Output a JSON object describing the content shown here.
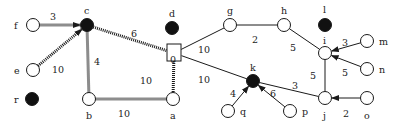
{
  "diagram": {
    "type": "weighted-graph",
    "style": {
      "ink": "#1a1a1a",
      "hollow_fill": "#ffffff",
      "solid_fill": "#111111",
      "background": "#ffffff"
    },
    "nodes": [
      {
        "id": "f",
        "label": "f",
        "x": 33,
        "y": 25,
        "kind": "hollow",
        "lx": 14,
        "ly": 29
      },
      {
        "id": "c",
        "label": "c",
        "x": 87,
        "y": 25,
        "kind": "solid",
        "lx": 84,
        "ly": 14
      },
      {
        "id": "e",
        "label": "e",
        "x": 33,
        "y": 70,
        "kind": "hollow",
        "lx": 14,
        "ly": 74
      },
      {
        "id": "r",
        "label": "r",
        "x": 32,
        "y": 99,
        "kind": "solid",
        "lx": 14,
        "ly": 103
      },
      {
        "id": "b",
        "label": "b",
        "x": 89,
        "y": 99,
        "kind": "hollow",
        "lx": 86,
        "ly": 119
      },
      {
        "id": "a",
        "label": "a",
        "x": 173,
        "y": 99,
        "kind": "hollow",
        "lx": 170,
        "ly": 119
      },
      {
        "id": "0",
        "label": "0",
        "x": 174,
        "y": 53,
        "kind": "square",
        "lx": 170,
        "ly": 63
      },
      {
        "id": "d",
        "label": "d",
        "x": 172,
        "y": 28,
        "kind": "solid",
        "lx": 169,
        "ly": 17
      },
      {
        "id": "g",
        "label": "g",
        "x": 230,
        "y": 25,
        "kind": "hollow",
        "lx": 227,
        "ly": 14
      },
      {
        "id": "h",
        "label": "h",
        "x": 284,
        "y": 25,
        "kind": "hollow",
        "lx": 281,
        "ly": 14
      },
      {
        "id": "l",
        "label": "l",
        "x": 325,
        "y": 25,
        "kind": "solid",
        "lx": 323,
        "ly": 13
      },
      {
        "id": "i",
        "label": "i",
        "x": 325,
        "y": 53,
        "kind": "hollow",
        "lx": 323,
        "ly": 44
      },
      {
        "id": "m",
        "label": "m",
        "x": 367,
        "y": 41,
        "kind": "hollow",
        "lx": 379,
        "ly": 45
      },
      {
        "id": "n",
        "label": "n",
        "x": 367,
        "y": 69,
        "kind": "hollow",
        "lx": 379,
        "ly": 73
      },
      {
        "id": "k",
        "label": "k",
        "x": 253,
        "y": 81,
        "kind": "solid",
        "lx": 250,
        "ly": 71
      },
      {
        "id": "q",
        "label": "q",
        "x": 228,
        "y": 111,
        "kind": "hollow",
        "lx": 240,
        "ly": 115
      },
      {
        "id": "p",
        "label": "p",
        "x": 290,
        "y": 111,
        "kind": "hollow",
        "lx": 302,
        "ly": 115
      },
      {
        "id": "j",
        "label": "j",
        "x": 325,
        "y": 98,
        "kind": "hollow",
        "lx": 323,
        "ly": 119
      },
      {
        "id": "o",
        "label": "o",
        "x": 367,
        "y": 98,
        "kind": "hollow",
        "lx": 364,
        "ly": 119
      }
    ],
    "edges": [
      {
        "from": "f",
        "to": "c",
        "weight": "3",
        "style": "dotted",
        "arrow": true,
        "wx": 53,
        "wy": 20
      },
      {
        "from": "e",
        "to": "c",
        "weight": "10",
        "style": "dotted",
        "arrow": true,
        "wx": 58,
        "wy": 73
      },
      {
        "from": "c",
        "to": "0",
        "weight": "6",
        "style": "dotted",
        "arrow": false,
        "wx": 134,
        "wy": 37
      },
      {
        "from": "c",
        "to": "b",
        "weight": "4",
        "style": "dotted",
        "arrow": false,
        "wx": 97,
        "wy": 65
      },
      {
        "from": "b",
        "to": "a",
        "weight": "10",
        "style": "dotted",
        "arrow": false,
        "wx": 124,
        "wy": 117
      },
      {
        "from": "0",
        "to": "a",
        "weight": "10",
        "style": "dotted",
        "arrow": false,
        "wx": 146,
        "wy": 84
      },
      {
        "from": "0",
        "to": "g",
        "weight": "10",
        "style": "solid",
        "arrow": false,
        "wx": 204,
        "wy": 53
      },
      {
        "from": "0",
        "to": "k",
        "weight": "10",
        "style": "solid",
        "arrow": false,
        "wx": 204,
        "wy": 83
      },
      {
        "from": "g",
        "to": "h",
        "weight": "2",
        "style": "solid",
        "arrow": false,
        "wx": 255,
        "wy": 43
      },
      {
        "from": "h",
        "to": "i",
        "weight": "5",
        "style": "solid",
        "arrow": false,
        "wx": 293,
        "wy": 51
      },
      {
        "from": "i",
        "to": "j",
        "weight": "5",
        "style": "solid",
        "arrow": false,
        "wx": 313,
        "wy": 79
      },
      {
        "from": "m",
        "to": "i",
        "weight": "3",
        "style": "solid",
        "arrow": true,
        "wx": 345,
        "wy": 46
      },
      {
        "from": "n",
        "to": "i",
        "weight": "5",
        "style": "solid",
        "arrow": true,
        "wx": 345,
        "wy": 76
      },
      {
        "from": "j",
        "to": "k",
        "weight": "3",
        "style": "solid",
        "arrow": false,
        "wx": 295,
        "wy": 89
      },
      {
        "from": "q",
        "to": "k",
        "weight": "4",
        "style": "solid",
        "arrow": true,
        "wx": 233,
        "wy": 97
      },
      {
        "from": "p",
        "to": "k",
        "weight": "6",
        "style": "solid",
        "arrow": true,
        "wx": 273,
        "wy": 97
      },
      {
        "from": "o",
        "to": "j",
        "weight": "2",
        "style": "solid",
        "arrow": true,
        "wx": 346,
        "wy": 117
      }
    ]
  }
}
